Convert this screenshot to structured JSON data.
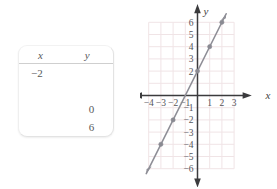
{
  "table": {
    "headers": {
      "x": "x",
      "y": "y"
    },
    "rows": [
      {
        "x": "−2",
        "y": ""
      },
      {
        "x": "",
        "y": ""
      },
      {
        "x": "",
        "y": "0"
      },
      {
        "x": "",
        "y": "6"
      }
    ]
  },
  "chart_data": {
    "type": "line",
    "title": "",
    "xlabel": "x",
    "ylabel": "y",
    "xlim": [
      -4.5,
      3.5
    ],
    "ylim": [
      -6.5,
      6.5
    ],
    "grid": true,
    "legend": "none",
    "x_ticks": [
      -4,
      -3,
      -2,
      -1,
      1,
      2,
      3
    ],
    "x_tick_labels": [
      "−4",
      "−3",
      "−2",
      "−1",
      "1",
      "2",
      "3"
    ],
    "y_ticks": [
      6,
      5,
      4,
      3,
      2,
      -1,
      -2,
      -3,
      -4,
      -5,
      -6
    ],
    "y_tick_labels": [
      "6",
      "5",
      "4",
      "3",
      "2",
      "−1",
      "−2",
      "−3",
      "−4",
      "−5",
      "−6"
    ],
    "series": [
      {
        "name": "y = 2x + 2",
        "slope": 2,
        "intercept": 2,
        "line_from": [
          -4.2,
          -6.4
        ],
        "line_to": [
          2.35,
          6.7
        ],
        "points": [
          {
            "x": -3,
            "y": -4
          },
          {
            "x": -2,
            "y": -2
          },
          {
            "x": 0,
            "y": 2
          },
          {
            "x": 1,
            "y": 4
          },
          {
            "x": 2,
            "y": 6
          }
        ]
      }
    ],
    "colors": {
      "line": "#8f8f97",
      "point": "#8a8a92",
      "axis": "#3b3b3d",
      "grid": "#f0e4e6",
      "tick_label": "#55555a"
    }
  }
}
